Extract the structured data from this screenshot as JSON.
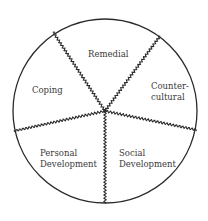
{
  "diagram": {
    "type": "divided-circle",
    "colors": {
      "stroke": "#2a2a2a",
      "text": "#3a3a3a",
      "background": "#ffffff"
    },
    "segments": [
      {
        "id": "remedial",
        "lines": [
          "Remedial"
        ]
      },
      {
        "id": "counter-cultural",
        "lines": [
          "Counter-",
          "cultural"
        ]
      },
      {
        "id": "social-development",
        "lines": [
          "Social",
          "Development"
        ]
      },
      {
        "id": "personal-development",
        "lines": [
          "Personal",
          "Development"
        ]
      },
      {
        "id": "coping",
        "lines": [
          "Coping"
        ]
      }
    ]
  }
}
